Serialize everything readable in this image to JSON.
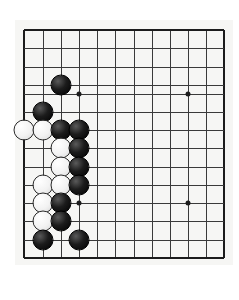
{
  "app": {
    "title": "Go Problem Board",
    "background_color": "#ffffff"
  },
  "board": {
    "name": "go-board",
    "board_color": "#f6f6f4",
    "line_color": "#3a3a3a",
    "edge_color": "#1c1c1c",
    "columns": 12,
    "rows": 13,
    "column_x": [
      24,
      43,
      61,
      79,
      97,
      115,
      134,
      152,
      170,
      188,
      206,
      224
    ],
    "row_y": [
      30,
      48,
      67,
      85,
      94,
      112,
      130,
      148,
      167,
      185,
      203,
      221,
      240,
      258
    ],
    "star_points": [
      {
        "name": "star-point-upper-left",
        "col": 4,
        "row": 5
      },
      {
        "name": "star-point-upper-right",
        "col": 10,
        "row": 5
      },
      {
        "name": "star-point-lower-left",
        "col": 4,
        "row": 11
      },
      {
        "name": "star-point-lower-right",
        "col": 10,
        "row": 11
      }
    ],
    "stones": [
      {
        "color": "black",
        "col": 3,
        "row": 4
      },
      {
        "color": "black",
        "col": 2,
        "row": 6
      },
      {
        "color": "white",
        "col": 1,
        "row": 7
      },
      {
        "color": "white",
        "col": 2,
        "row": 7
      },
      {
        "color": "black",
        "col": 3,
        "row": 7
      },
      {
        "color": "black",
        "col": 4,
        "row": 7
      },
      {
        "color": "white",
        "col": 3,
        "row": 8
      },
      {
        "color": "black",
        "col": 4,
        "row": 8
      },
      {
        "color": "white",
        "col": 3,
        "row": 9
      },
      {
        "color": "black",
        "col": 4,
        "row": 9
      },
      {
        "color": "white",
        "col": 2,
        "row": 10
      },
      {
        "color": "white",
        "col": 3,
        "row": 10
      },
      {
        "color": "black",
        "col": 4,
        "row": 10
      },
      {
        "color": "white",
        "col": 2,
        "row": 11
      },
      {
        "color": "black",
        "col": 3,
        "row": 11
      },
      {
        "color": "white",
        "col": 2,
        "row": 12
      },
      {
        "color": "black",
        "col": 3,
        "row": 12
      },
      {
        "color": "black",
        "col": 2,
        "row": 13
      },
      {
        "color": "black",
        "col": 4,
        "row": 13
      }
    ]
  },
  "caption": {
    "label": "问题 99",
    "chip_color": "#e2e2e2",
    "text_color": "#333333",
    "marker": "corner-triangle-icon"
  }
}
